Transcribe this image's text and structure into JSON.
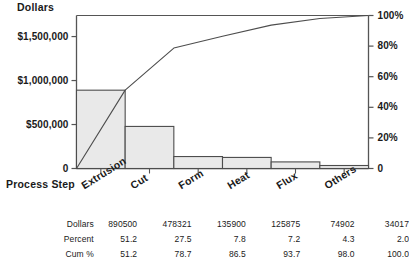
{
  "chart_data": {
    "type": "bar",
    "title": "",
    "ylabel": "Dollars",
    "xlabel": "Process Step",
    "y2label": "",
    "grid": false,
    "legend": "none",
    "categories": [
      "Extrusion",
      "Cut",
      "Form",
      "Heat",
      "Flux",
      "Others"
    ],
    "series": [
      {
        "name": "Dollars",
        "type": "bar",
        "values": [
          890500,
          478321,
          135900,
          125875,
          74902,
          34017
        ]
      },
      {
        "name": "Cum %",
        "type": "line",
        "values": [
          51.2,
          78.7,
          86.5,
          93.7,
          98.0,
          100.0
        ]
      }
    ],
    "percent": [
      51.2,
      27.5,
      7.8,
      7.2,
      4.3,
      2.0
    ],
    "ylim": [
      0,
      1739515
    ],
    "y2lim": [
      0,
      100
    ],
    "yticks": [
      0,
      500000,
      1000000,
      1500000
    ],
    "ytick_labels": [
      "0",
      "$500,000",
      "$1,000,000",
      "$1,500,000"
    ],
    "y2ticks": [
      0,
      20,
      40,
      60,
      80,
      100
    ],
    "y2tick_labels": [
      "0",
      "20%",
      "40%",
      "60%",
      "80%",
      "100%"
    ],
    "bar_fill": "#e9e9e9",
    "bar_stroke": "#4d4d4d",
    "line_color": "#4d4d4d",
    "axis_color": "#555555"
  },
  "table": {
    "row_labels": [
      "Dollars",
      "Percent",
      "Cum %"
    ],
    "rows": [
      [
        "890500",
        "478321",
        "135900",
        "125875",
        "74902",
        "34017"
      ],
      [
        "51.2",
        "27.5",
        "7.8",
        "7.2",
        "4.3",
        "2.0"
      ],
      [
        "51.2",
        "78.7",
        "86.5",
        "93.7",
        "98.0",
        "100.0"
      ]
    ]
  }
}
